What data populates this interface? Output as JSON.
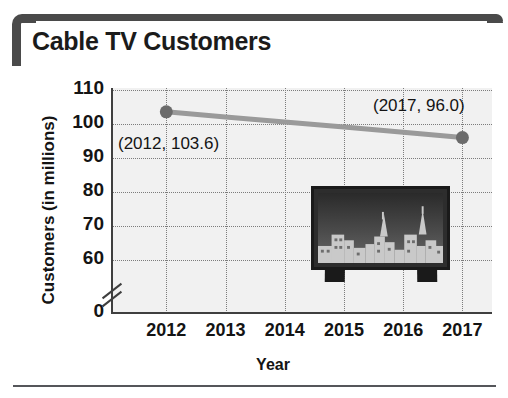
{
  "header": {
    "title": "Cable TV Customers",
    "bracket_color": "#4a4a4a"
  },
  "chart_data": {
    "type": "line",
    "title": "Cable TV Customers",
    "xlabel": "Year",
    "ylabel": "Customers (in millions)",
    "categories": [
      "2012",
      "2013",
      "2014",
      "2015",
      "2016",
      "2017"
    ],
    "x": [
      2012,
      2013,
      2014,
      2015,
      2016,
      2017
    ],
    "values": [
      103.6,
      102.1,
      100.6,
      99.1,
      97.6,
      96.0
    ],
    "series": [
      {
        "name": "Cable TV Customers",
        "values": [
          103.6,
          102.1,
          100.6,
          99.1,
          97.6,
          96.0
        ],
        "line_color": "#9a9a9a",
        "marker_color": "#6b6b6b"
      }
    ],
    "ylim": [
      60,
      110
    ],
    "ytick_labels": [
      "110",
      "100",
      "90",
      "80",
      "70",
      "60",
      "0"
    ],
    "ytick_values": [
      110,
      100,
      90,
      80,
      70,
      60,
      0
    ],
    "axis_break": true,
    "axis_break_between": [
      0,
      60
    ],
    "grid": true,
    "grid_style": "dotted",
    "legend": "none",
    "plot_background": "#f1f1f1",
    "annotations": [
      {
        "id": "annot-2012",
        "text": "(2012, 103.6)",
        "point_x": 2012,
        "point_y": 103.6
      },
      {
        "id": "annot-2017",
        "text": "(2017, 96.0)",
        "point_x": 2017,
        "point_y": 96.0
      }
    ],
    "decoration": {
      "name": "television-with-city-skyline",
      "description": "flat-screen TV displaying a city skyline silhouette"
    }
  }
}
